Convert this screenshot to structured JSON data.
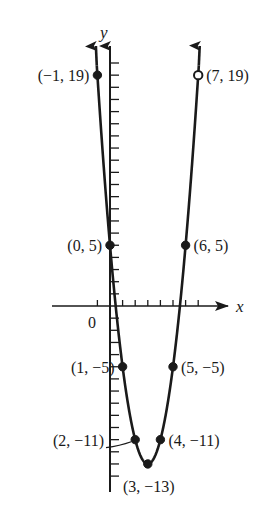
{
  "chart_data": {
    "type": "line",
    "title": "",
    "xlabel": "x",
    "ylabel": "y",
    "origin_label": "0",
    "function": "y = 2x^2 - 12x + 5",
    "xlim": [
      -1.5,
      8.5
    ],
    "ylim": [
      -14.5,
      21
    ],
    "grid": false,
    "x_ticks": [
      -1,
      0,
      1,
      2,
      3,
      4,
      5,
      6,
      7
    ],
    "y_ticks_step": 1,
    "points": [
      {
        "x": -1,
        "y": 19,
        "label": "(−1, 19)",
        "side": "left"
      },
      {
        "x": 7,
        "y": 19,
        "label": "(7, 19)",
        "side": "right",
        "open": true
      },
      {
        "x": 0,
        "y": 5,
        "label": "(0, 5)",
        "side": "left"
      },
      {
        "x": 6,
        "y": 5,
        "label": "(6, 5)",
        "side": "right"
      },
      {
        "x": 1,
        "y": -5,
        "label": "(1, −5)",
        "side": "left"
      },
      {
        "x": 5,
        "y": -5,
        "label": "(5, −5)",
        "side": "right"
      },
      {
        "x": 2,
        "y": -11,
        "label": "(2, −11)",
        "side": "left"
      },
      {
        "x": 4,
        "y": -11,
        "label": "(4, −11)",
        "side": "right"
      },
      {
        "x": 3,
        "y": -13,
        "label": "(3, −13)",
        "side": "below"
      }
    ],
    "colors": {
      "curve": "#1a1a1a",
      "axes": "#1a1a1a",
      "background": "#ffffff"
    }
  }
}
